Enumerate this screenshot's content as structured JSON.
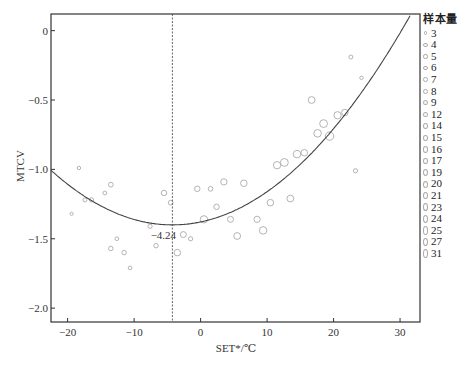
{
  "chart_data": {
    "type": "scatter",
    "title": "",
    "xlabel": "SET*/℃",
    "ylabel": "MTCV",
    "xlim": [
      -22.5,
      33
    ],
    "ylim": [
      -2.1,
      0.12
    ],
    "x_ticks": [
      -20,
      -10,
      0,
      10,
      20,
      30
    ],
    "y_ticks": [
      0,
      -0.5,
      -1.0,
      -1.5,
      -2.0
    ],
    "x_tick_labels": [
      "−20",
      "−10",
      "0",
      "10",
      "20",
      "30"
    ],
    "y_tick_labels": [
      "0",
      "−0.5",
      "−1.0",
      "−1.5",
      "−2.0"
    ],
    "grid": false,
    "legend_position": "right",
    "legend_title": "样本量",
    "legend_entries": [
      "3",
      "4",
      "5",
      "6",
      "7",
      "8",
      "9",
      "12",
      "14",
      "15",
      "16",
      "17",
      "19",
      "20",
      "21",
      "23",
      "24",
      "25",
      "27",
      "31"
    ],
    "fit_curve": {
      "type": "quadratic",
      "vertex_x": -4.24,
      "vertex_y": -1.4,
      "a": 0.00118
    },
    "reference_line": {
      "x": -4.24,
      "style": "dotted",
      "label": "−4.24"
    },
    "points": [
      {
        "x": -18.3,
        "y": -0.99,
        "n": 4
      },
      {
        "x": -19.4,
        "y": -1.32,
        "n": 3
      },
      {
        "x": -17.4,
        "y": -1.22,
        "n": 6
      },
      {
        "x": -16.4,
        "y": -1.22,
        "n": 7
      },
      {
        "x": -14.4,
        "y": -1.17,
        "n": 5
      },
      {
        "x": -13.5,
        "y": -1.11,
        "n": 9
      },
      {
        "x": -12.6,
        "y": -1.5,
        "n": 5
      },
      {
        "x": -11.5,
        "y": -1.6,
        "n": 8
      },
      {
        "x": -10.6,
        "y": -1.71,
        "n": 5
      },
      {
        "x": -13.5,
        "y": -1.57,
        "n": 8
      },
      {
        "x": -7.6,
        "y": -1.41,
        "n": 7
      },
      {
        "x": -6.7,
        "y": -1.55,
        "n": 8
      },
      {
        "x": -5.5,
        "y": -1.17,
        "n": 12
      },
      {
        "x": -4.5,
        "y": -1.24,
        "n": 9
      },
      {
        "x": -3.5,
        "y": -1.6,
        "n": 16
      },
      {
        "x": -2.6,
        "y": -1.47,
        "n": 14
      },
      {
        "x": -1.5,
        "y": -1.5,
        "n": 7
      },
      {
        "x": -0.5,
        "y": -1.14,
        "n": 12
      },
      {
        "x": 1.5,
        "y": -1.14,
        "n": 9
      },
      {
        "x": 3.5,
        "y": -1.09,
        "n": 15
      },
      {
        "x": 6.5,
        "y": -1.1,
        "n": 16
      },
      {
        "x": 2.4,
        "y": -1.27,
        "n": 12
      },
      {
        "x": 0.5,
        "y": -1.36,
        "n": 19
      },
      {
        "x": 4.5,
        "y": -1.36,
        "n": 14
      },
      {
        "x": 5.5,
        "y": -1.48,
        "n": 17
      },
      {
        "x": 8.5,
        "y": -1.36,
        "n": 15
      },
      {
        "x": 9.4,
        "y": -1.44,
        "n": 20
      },
      {
        "x": 10.5,
        "y": -1.24,
        "n": 16
      },
      {
        "x": 13.5,
        "y": -1.21,
        "n": 17
      },
      {
        "x": 11.5,
        "y": -0.97,
        "n": 19
      },
      {
        "x": 12.6,
        "y": -0.95,
        "n": 21
      },
      {
        "x": 14.5,
        "y": -0.89,
        "n": 20
      },
      {
        "x": 15.6,
        "y": -0.88,
        "n": 16
      },
      {
        "x": 17.6,
        "y": -0.74,
        "n": 20
      },
      {
        "x": 19.4,
        "y": -0.76,
        "n": 23
      },
      {
        "x": 18.5,
        "y": -0.67,
        "n": 21
      },
      {
        "x": 20.6,
        "y": -0.61,
        "n": 19
      },
      {
        "x": 21.7,
        "y": -0.59,
        "n": 16
      },
      {
        "x": 16.7,
        "y": -0.5,
        "n": 17
      },
      {
        "x": 22.6,
        "y": -0.19,
        "n": 6
      },
      {
        "x": 24.2,
        "y": -0.34,
        "n": 4
      },
      {
        "x": 23.3,
        "y": -1.01,
        "n": 7
      }
    ]
  },
  "colors": {
    "axis": "#333333",
    "curve": "#444444",
    "marker": "#aaaaaa",
    "refline": "#555555"
  }
}
